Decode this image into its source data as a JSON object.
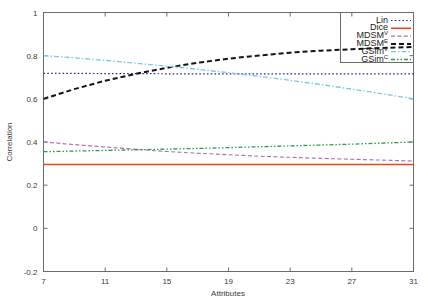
{
  "chart_data": {
    "type": "line",
    "title": "",
    "xlabel": "Attributes",
    "ylabel": "Correlation",
    "xlim": [
      7,
      31
    ],
    "ylim": [
      -0.2,
      1
    ],
    "xticks": [
      7,
      11,
      15,
      19,
      23,
      27,
      31
    ],
    "xtick_labels": [
      "7",
      "11",
      "15",
      "19",
      "23",
      "27",
      "31"
    ],
    "yticks": [
      -0.2,
      0,
      0.2,
      0.4,
      0.6,
      0.8,
      1
    ],
    "ytick_labels": [
      "-0.2",
      "0",
      "0.2",
      "0.4",
      "0.6",
      "0.8",
      "1"
    ],
    "grid": false,
    "legend_position": "top-right",
    "x": [
      7,
      9,
      11,
      13,
      15,
      17,
      19,
      21,
      23,
      25,
      27,
      29,
      31
    ],
    "series": [
      {
        "name": "Lin",
        "label": "Lin",
        "superscript": "",
        "color": "#2a2a8c",
        "style": "dotted",
        "values": [
          0.718,
          0.718,
          0.717,
          0.717,
          0.716,
          0.716,
          0.716,
          0.716,
          0.716,
          0.716,
          0.716,
          0.716,
          0.716
        ]
      },
      {
        "name": "Dice",
        "label": "Dice",
        "superscript": "",
        "color": "#e04b18",
        "style": "solid",
        "values": [
          0.296,
          0.296,
          0.296,
          0.296,
          0.296,
          0.296,
          0.296,
          0.296,
          0.296,
          0.296,
          0.296,
          0.296,
          0.296
        ]
      },
      {
        "name": "MDSM-V",
        "label": "MDSM",
        "superscript": "V",
        "color": "#b06ab0",
        "style": "dashed",
        "values": [
          0.4,
          0.388,
          0.377,
          0.366,
          0.356,
          0.348,
          0.341,
          0.334,
          0.329,
          0.324,
          0.32,
          0.316,
          0.312
        ]
      },
      {
        "name": "MDSM-E",
        "label": "MDSM",
        "superscript": "E",
        "color": "#141414",
        "style": "heavy-dash",
        "values": [
          0.6,
          0.645,
          0.684,
          0.716,
          0.744,
          0.767,
          0.786,
          0.801,
          0.814,
          0.823,
          0.83,
          0.836,
          0.84
        ]
      },
      {
        "name": "GSim-V",
        "label": "GSim",
        "superscript": "V",
        "color": "#7cc8e0",
        "style": "dash-dot",
        "values": [
          0.8,
          0.79,
          0.778,
          0.765,
          0.751,
          0.737,
          0.721,
          0.704,
          0.686,
          0.666,
          0.645,
          0.623,
          0.6
        ]
      },
      {
        "name": "GSim-C",
        "label": "GSim",
        "superscript": "C",
        "color": "#2e9a4e",
        "style": "dash-dot-long",
        "values": [
          0.355,
          0.358,
          0.361,
          0.364,
          0.367,
          0.37,
          0.374,
          0.378,
          0.382,
          0.386,
          0.39,
          0.395,
          0.4
        ]
      }
    ]
  },
  "legend": {
    "entries": [
      {
        "label": "Lin",
        "superscript": ""
      },
      {
        "label": "Dice",
        "superscript": ""
      },
      {
        "label": "MDSM",
        "superscript": "V"
      },
      {
        "label": "MDSM",
        "superscript": "E"
      },
      {
        "label": "GSim",
        "superscript": "V"
      },
      {
        "label": "GSim",
        "superscript": "C"
      }
    ]
  },
  "colors": {
    "frame": "#6b6b6b",
    "text": "#3a3a3a",
    "background": "#ffffff"
  }
}
